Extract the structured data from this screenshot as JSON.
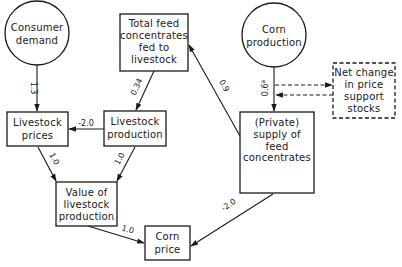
{
  "diagram": {
    "type": "flow-diagram",
    "nodes": [
      {
        "id": "consumer_demand",
        "shape": "circle",
        "lines": [
          "Consumer",
          "demand"
        ]
      },
      {
        "id": "total_feed",
        "shape": "box",
        "lines": [
          "Total feed",
          "concentrates",
          "fed to",
          "livestock"
        ]
      },
      {
        "id": "corn_production",
        "shape": "circle",
        "lines": [
          "Corn",
          "production"
        ]
      },
      {
        "id": "net_change",
        "shape": "dashed-box",
        "lines": [
          "Net change",
          "in price",
          "support",
          "stocks"
        ]
      },
      {
        "id": "livestock_prices",
        "shape": "box",
        "lines": [
          "Livestock",
          "prices"
        ]
      },
      {
        "id": "livestock_production",
        "shape": "box",
        "lines": [
          "Livestock",
          "production"
        ]
      },
      {
        "id": "private_supply",
        "shape": "box",
        "lines": [
          "(Private)",
          "supply of",
          "feed",
          "concentrates"
        ]
      },
      {
        "id": "value_livestock",
        "shape": "box",
        "lines": [
          "Value of",
          "livestock",
          "production"
        ]
      },
      {
        "id": "corn_price",
        "shape": "box",
        "lines": [
          "Corn",
          "price"
        ]
      }
    ],
    "edges": [
      {
        "from": "consumer_demand",
        "to": "livestock_prices",
        "label": "1.3"
      },
      {
        "from": "total_feed",
        "to": "livestock_production",
        "label": "0.34"
      },
      {
        "from": "livestock_production",
        "to": "livestock_prices",
        "label": "-2.0"
      },
      {
        "from": "livestock_prices",
        "to": "value_livestock",
        "label": "1.0"
      },
      {
        "from": "livestock_production",
        "to": "value_livestock",
        "label": "1.0"
      },
      {
        "from": "value_livestock",
        "to": "corn_price",
        "label": "1.0"
      },
      {
        "from": "private_supply",
        "to": "total_feed",
        "label": "0.9"
      },
      {
        "from": "corn_production",
        "to": "private_supply",
        "label": "0.6",
        "superscript": "a"
      },
      {
        "from": "private_supply",
        "to": "corn_price",
        "label": "-2.0"
      },
      {
        "from": "corn_production",
        "to": "net_change",
        "label": "",
        "style": "dashed"
      },
      {
        "from": "net_change",
        "to": "private_supply",
        "label": "",
        "style": "dashed"
      }
    ]
  }
}
